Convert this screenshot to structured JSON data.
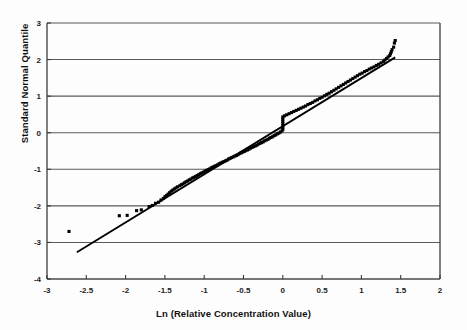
{
  "chart_data": {
    "type": "scatter",
    "title": "",
    "xlabel": "Ln (Relative Concentration Value)",
    "ylabel": "Standard Normal Quantile",
    "xlim": [
      -3,
      2
    ],
    "ylim": [
      -4,
      3
    ],
    "xticks": [
      -3,
      -2.5,
      -2,
      -1.5,
      -1,
      -0.5,
      0,
      0.5,
      1,
      1.5,
      2
    ],
    "xtick_labels": [
      "-3",
      "-2.5",
      "-2",
      "-1.5",
      "-1",
      "-0.5",
      "0",
      "0.5",
      "1",
      "1.5",
      "2"
    ],
    "yticks": [
      3,
      2,
      1,
      0,
      -1,
      -2,
      -3,
      -4
    ],
    "ytick_labels": [
      "3",
      "2",
      "1",
      "0",
      "-1",
      "-2",
      "-3",
      "-4"
    ],
    "grid": "horizontal",
    "marker": "square",
    "marker_color": "#000000",
    "marker_size": 3.1,
    "line_color": "#000000",
    "fit_line": {
      "label": "reference line",
      "x0": -2.62,
      "y0": -3.27,
      "x1": 1.43,
      "y1": 2.06
    },
    "series": [
      {
        "name": "Q-Q sample quantiles",
        "points": [
          [
            -2.72,
            -2.7
          ],
          [
            -2.08,
            -2.27
          ],
          [
            -1.98,
            -2.26
          ],
          [
            -1.86,
            -2.13
          ],
          [
            -1.8,
            -2.11
          ],
          [
            -1.7,
            -2.02
          ],
          [
            -1.66,
            -1.99
          ],
          [
            -1.62,
            -1.93
          ],
          [
            -1.58,
            -1.9
          ],
          [
            -1.55,
            -1.84
          ],
          [
            -1.52,
            -1.8
          ],
          [
            -1.5,
            -1.75
          ],
          [
            -1.48,
            -1.72
          ],
          [
            -1.46,
            -1.68
          ],
          [
            -1.44,
            -1.64
          ],
          [
            -1.42,
            -1.6
          ],
          [
            -1.4,
            -1.57
          ],
          [
            -1.38,
            -1.54
          ],
          [
            -1.36,
            -1.51
          ],
          [
            -1.34,
            -1.48
          ],
          [
            -1.31,
            -1.45
          ],
          [
            -1.29,
            -1.42
          ],
          [
            -1.27,
            -1.4
          ],
          [
            -1.25,
            -1.37
          ],
          [
            -1.23,
            -1.34
          ],
          [
            -1.21,
            -1.32
          ],
          [
            -1.19,
            -1.29
          ],
          [
            -1.17,
            -1.27
          ],
          [
            -1.15,
            -1.24
          ],
          [
            -1.13,
            -1.22
          ],
          [
            -1.11,
            -1.2
          ],
          [
            -1.09,
            -1.17
          ],
          [
            -1.07,
            -1.15
          ],
          [
            -1.05,
            -1.12
          ],
          [
            -1.03,
            -1.1
          ],
          [
            -1.01,
            -1.08
          ],
          [
            -0.99,
            -1.05
          ],
          [
            -0.97,
            -1.03
          ],
          [
            -0.95,
            -1.01
          ],
          [
            -0.93,
            -0.99
          ],
          [
            -0.91,
            -0.96
          ],
          [
            -0.89,
            -0.94
          ],
          [
            -0.87,
            -0.92
          ],
          [
            -0.85,
            -0.9
          ],
          [
            -0.83,
            -0.88
          ],
          [
            -0.81,
            -0.85
          ],
          [
            -0.79,
            -0.83
          ],
          [
            -0.77,
            -0.81
          ],
          [
            -0.75,
            -0.79
          ],
          [
            -0.73,
            -0.77
          ],
          [
            -0.71,
            -0.75
          ],
          [
            -0.69,
            -0.72
          ],
          [
            -0.67,
            -0.7
          ],
          [
            -0.65,
            -0.68
          ],
          [
            -0.63,
            -0.66
          ],
          [
            -0.61,
            -0.64
          ],
          [
            -0.59,
            -0.62
          ],
          [
            -0.57,
            -0.6
          ],
          [
            -0.55,
            -0.57
          ],
          [
            -0.53,
            -0.55
          ],
          [
            -0.51,
            -0.53
          ],
          [
            -0.49,
            -0.51
          ],
          [
            -0.47,
            -0.49
          ],
          [
            -0.45,
            -0.47
          ],
          [
            -0.43,
            -0.45
          ],
          [
            -0.41,
            -0.42
          ],
          [
            -0.39,
            -0.4
          ],
          [
            -0.37,
            -0.38
          ],
          [
            -0.35,
            -0.36
          ],
          [
            -0.33,
            -0.34
          ],
          [
            -0.31,
            -0.31
          ],
          [
            -0.29,
            -0.29
          ],
          [
            -0.27,
            -0.27
          ],
          [
            -0.25,
            -0.25
          ],
          [
            -0.23,
            -0.22
          ],
          [
            -0.21,
            -0.2
          ],
          [
            -0.19,
            -0.18
          ],
          [
            -0.17,
            -0.15
          ],
          [
            -0.15,
            -0.13
          ],
          [
            -0.13,
            -0.11
          ],
          [
            -0.11,
            -0.08
          ],
          [
            -0.09,
            -0.06
          ],
          [
            -0.07,
            -0.03
          ],
          [
            -0.05,
            -0.01
          ],
          [
            -0.03,
            0.02
          ],
          [
            -0.01,
            0.05
          ],
          [
            0.0,
            0.09
          ],
          [
            0.0,
            0.14
          ],
          [
            0.0,
            0.19
          ],
          [
            0.0,
            0.25
          ],
          [
            0.0,
            0.31
          ],
          [
            0.0,
            0.37
          ],
          [
            0.0,
            0.43
          ],
          [
            0.02,
            0.46
          ],
          [
            0.05,
            0.49
          ],
          [
            0.08,
            0.52
          ],
          [
            0.11,
            0.55
          ],
          [
            0.14,
            0.58
          ],
          [
            0.17,
            0.61
          ],
          [
            0.2,
            0.64
          ],
          [
            0.23,
            0.67
          ],
          [
            0.26,
            0.7
          ],
          [
            0.29,
            0.73
          ],
          [
            0.32,
            0.77
          ],
          [
            0.35,
            0.8
          ],
          [
            0.38,
            0.83
          ],
          [
            0.41,
            0.87
          ],
          [
            0.44,
            0.9
          ],
          [
            0.47,
            0.94
          ],
          [
            0.5,
            0.97
          ],
          [
            0.53,
            1.01
          ],
          [
            0.56,
            1.05
          ],
          [
            0.59,
            1.08
          ],
          [
            0.62,
            1.12
          ],
          [
            0.65,
            1.16
          ],
          [
            0.68,
            1.2
          ],
          [
            0.71,
            1.24
          ],
          [
            0.74,
            1.28
          ],
          [
            0.77,
            1.32
          ],
          [
            0.8,
            1.36
          ],
          [
            0.83,
            1.4
          ],
          [
            0.86,
            1.44
          ],
          [
            0.89,
            1.48
          ],
          [
            0.92,
            1.52
          ],
          [
            0.95,
            1.56
          ],
          [
            0.98,
            1.6
          ],
          [
            1.01,
            1.63
          ],
          [
            1.04,
            1.67
          ],
          [
            1.07,
            1.7
          ],
          [
            1.1,
            1.74
          ],
          [
            1.13,
            1.77
          ],
          [
            1.16,
            1.8
          ],
          [
            1.19,
            1.84
          ],
          [
            1.22,
            1.87
          ],
          [
            1.25,
            1.91
          ],
          [
            1.28,
            1.95
          ],
          [
            1.3,
            1.99
          ],
          [
            1.32,
            2.03
          ],
          [
            1.34,
            2.07
          ],
          [
            1.36,
            2.11
          ],
          [
            1.37,
            2.16
          ],
          [
            1.38,
            2.21
          ],
          [
            1.39,
            2.27
          ],
          [
            1.41,
            2.34
          ],
          [
            1.42,
            2.45
          ],
          [
            1.43,
            2.52
          ]
        ]
      }
    ]
  }
}
